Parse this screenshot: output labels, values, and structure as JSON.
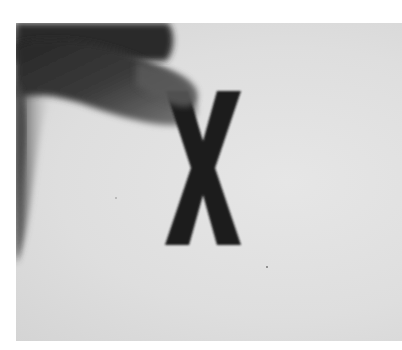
{
  "image": {
    "description": "Grayscale photograph of fingers holding a black capital letter X against a light gray background",
    "subject_letter": "X",
    "colors": {
      "background": "#e2e2e2",
      "letter": "#1a1a1a",
      "finger_dark": "#2e2e2e",
      "finger_mid": "#6a6a6a",
      "page_border": "#ffffff"
    }
  }
}
